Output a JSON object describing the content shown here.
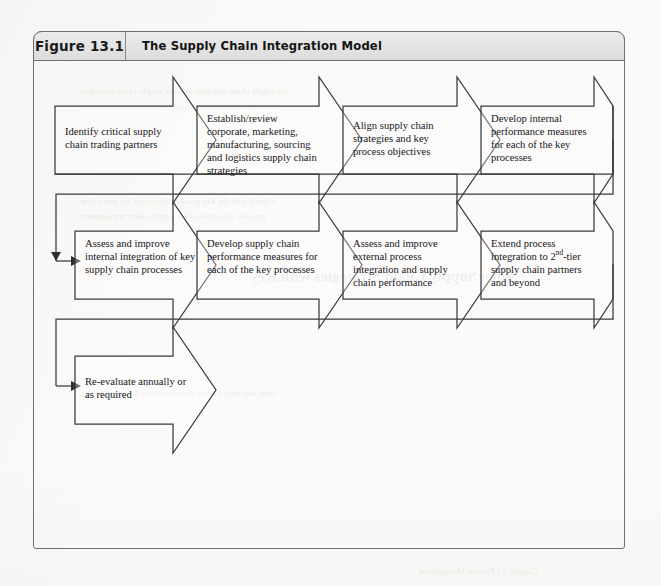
{
  "figure": {
    "label": "Figure 13.1",
    "title": "The Supply Chain Integration Model"
  },
  "diagram": {
    "type": "process-flow",
    "rows": [
      {
        "id": "row-1",
        "steps": [
          {
            "id": "step-1",
            "text": "Identify critical supply chain trading partners"
          },
          {
            "id": "step-2",
            "text": "Establish/review corporate, marketing, manufacturing, sourcing and logistics supply chain strategies"
          },
          {
            "id": "step-3",
            "text": "Align supply chain strategies and key process objectives"
          },
          {
            "id": "step-4",
            "text": "Develop internal performance measures for each of the key processes"
          }
        ]
      },
      {
        "id": "row-2",
        "steps": [
          {
            "id": "step-5",
            "text": "Assess and improve internal integration of  key supply chain processes"
          },
          {
            "id": "step-6",
            "text": "Develop supply chain performance measures for each of the key processes"
          },
          {
            "id": "step-7",
            "text": "Assess and improve external process integration and supply chain performance"
          },
          {
            "id": "step-8",
            "text_html": "Extend process integration to 2<sup>nd</sup>-tier supply chain partners and beyond"
          }
        ]
      },
      {
        "id": "row-3",
        "steps": [
          {
            "id": "step-9",
            "text": "Re-evaluate annually or as required"
          }
        ]
      }
    ],
    "connectors": [
      {
        "id": "connector-row1-to-row2",
        "from": "step-4",
        "to": "step-5"
      },
      {
        "id": "connector-row2-to-row3",
        "from": "step-8",
        "to": "step-9"
      }
    ]
  },
  "colors": {
    "frame_border": "#6f6f72",
    "header_fill": "#e4e4e4",
    "shape_stroke": "#3a3a3c",
    "text": "#16161a",
    "page_background": "#fbfaf8"
  },
  "showthrough": {
    "heading": "Align Supply Chain Strategies with Key",
    "lines": [
      "the supply chain members and the supply chain strategies",
      "on to the firms and their supply chain partners to align",
      "aligned with the key process objectives for every firm",
      "process objectives is the supply chain management",
      "firms and their trading partners along the supply chain"
    ],
    "footer": "Chapter 13 Process Management"
  }
}
